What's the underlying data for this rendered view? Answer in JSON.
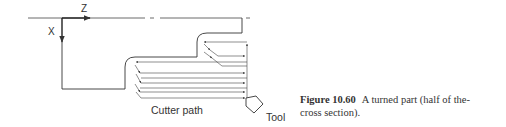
{
  "figure": {
    "number": "Figure 10.60",
    "caption_line1": "A turned part (half of the-",
    "caption_line2": "cross section)."
  },
  "diagram": {
    "axis_z_label": "Z",
    "axis_x_label": "X",
    "cutter_path_label": "Cutter path",
    "tool_label": "Tool",
    "line_color": "#333333"
  }
}
